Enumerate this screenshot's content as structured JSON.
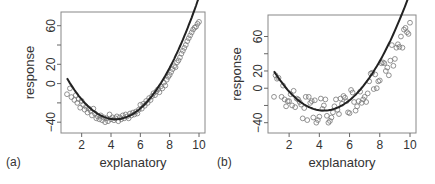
{
  "chart_data": [
    {
      "panel_label": "(a)",
      "type": "scatter",
      "title": "",
      "xlabel": "explanatory",
      "ylabel": "response",
      "xlim": [
        1,
        10
      ],
      "ylim": [
        -45,
        68
      ],
      "xticks": [
        2,
        4,
        6,
        8,
        10
      ],
      "yticks": [
        -40,
        -20,
        0,
        20,
        40,
        60
      ],
      "ytick_labels": [
        "-40",
        "",
        "0",
        "20",
        "",
        "60"
      ],
      "grid": false,
      "fit": {
        "type": "quadratic",
        "vertex_x": 4.3,
        "vertex_y": -37,
        "curve": "y = 3.9*(x-4.3)^2 - 37"
      },
      "points_x": [
        1.0,
        1.2,
        1.3,
        1.5,
        1.6,
        1.7,
        1.8,
        1.9,
        2.0,
        2.1,
        2.2,
        2.3,
        2.4,
        2.5,
        2.6,
        2.7,
        2.8,
        2.9,
        3.0,
        3.1,
        3.2,
        3.3,
        3.4,
        3.5,
        3.6,
        3.7,
        3.8,
        3.9,
        4.0,
        4.1,
        4.2,
        4.3,
        4.4,
        4.5,
        4.6,
        4.7,
        4.8,
        4.9,
        5.0,
        5.1,
        5.2,
        5.3,
        5.4,
        5.5,
        5.6,
        5.7,
        5.8,
        5.9,
        6.0,
        6.1,
        6.2,
        6.3,
        6.4,
        6.5,
        6.6,
        6.7,
        6.8,
        6.9,
        7.0,
        7.1,
        7.2,
        7.3,
        7.4,
        7.5,
        7.6,
        7.7,
        7.8,
        7.9,
        8.0,
        8.1,
        8.2,
        8.3,
        8.4,
        8.5,
        8.6,
        8.7,
        8.8,
        8.9,
        9.0,
        9.1,
        9.2,
        9.3,
        9.4,
        9.5,
        9.6,
        9.7,
        9.8,
        9.9,
        10.0
      ],
      "points_y": [
        -11,
        -5,
        -14,
        -17,
        -12,
        -20,
        -16,
        -25,
        -18,
        -22,
        -27,
        -24,
        -30,
        -26,
        -28,
        -33,
        -26,
        -31,
        -36,
        -34,
        -37,
        -33,
        -38,
        -35,
        -40,
        -36,
        -39,
        -32,
        -37,
        -35,
        -38,
        -36,
        -34,
        -39,
        -35,
        -37,
        -33,
        -36,
        -32,
        -34,
        -36,
        -31,
        -33,
        -30,
        -32,
        -29,
        -31,
        -27,
        -22,
        -26,
        -21,
        -23,
        -18,
        -20,
        -15,
        -17,
        -13,
        -10,
        -12,
        -8,
        -6,
        -9,
        -3,
        -5,
        1,
        -2,
        4,
        7,
        9,
        12,
        15,
        18,
        17,
        22,
        24,
        27,
        31,
        34,
        37,
        40,
        44,
        47,
        50,
        53,
        56,
        58,
        59,
        62,
        64
      ]
    },
    {
      "panel_label": "(b)",
      "type": "scatter",
      "title": "",
      "xlabel": "explanatory",
      "ylabel": "response",
      "xlim": [
        1,
        10
      ],
      "ylim": [
        -45,
        78
      ],
      "xticks": [
        2,
        4,
        6,
        8,
        10
      ],
      "yticks": [
        -40,
        -20,
        0,
        20,
        40,
        60
      ],
      "ytick_labels": [
        "-40",
        "",
        "0",
        "20",
        "",
        "60"
      ],
      "grid": false,
      "fit": {
        "type": "quadratic",
        "vertex_x": 4.3,
        "vertex_y": -26,
        "curve": "y = 4.2*(x-4.3)^2 - 26"
      },
      "points_x": [
        1.0,
        1.1,
        1.2,
        1.3,
        1.5,
        1.6,
        1.7,
        1.8,
        1.9,
        2.0,
        2.1,
        2.2,
        2.3,
        2.4,
        2.5,
        2.6,
        2.7,
        2.8,
        2.9,
        3.0,
        3.1,
        3.2,
        3.3,
        3.4,
        3.5,
        3.6,
        3.7,
        3.8,
        3.9,
        4.0,
        4.1,
        4.2,
        4.3,
        4.4,
        4.5,
        4.6,
        4.7,
        4.8,
        4.9,
        5.0,
        5.1,
        5.2,
        5.3,
        5.4,
        5.5,
        5.6,
        5.7,
        5.8,
        5.9,
        6.0,
        6.1,
        6.2,
        6.3,
        6.4,
        6.5,
        6.6,
        6.7,
        6.8,
        6.9,
        7.0,
        7.1,
        7.2,
        7.3,
        7.4,
        7.5,
        7.6,
        7.7,
        7.8,
        7.9,
        8.0,
        8.1,
        8.2,
        8.3,
        8.4,
        8.5,
        8.6,
        8.7,
        8.8,
        8.9,
        9.0,
        9.1,
        9.2,
        9.3,
        9.4,
        9.5,
        9.6,
        9.7,
        9.8,
        9.9,
        10.0
      ],
      "points_y": [
        -10,
        15,
        11,
        12,
        -10,
        3,
        -13,
        -21,
        -15,
        -15,
        -7,
        -20,
        -3,
        -22,
        -12,
        -13,
        -16,
        -19,
        -35,
        -23,
        -10,
        -37,
        -10,
        -17,
        -15,
        -34,
        -14,
        -40,
        -37,
        -33,
        -12,
        -24,
        -20,
        -13,
        -32,
        -40,
        -38,
        -34,
        -28,
        -21,
        -13,
        -25,
        -30,
        -12,
        -18,
        -9,
        -11,
        -15,
        -28,
        -29,
        -2,
        -5,
        -16,
        -26,
        -21,
        -15,
        -4,
        -17,
        -13,
        -10,
        -16,
        -6,
        8,
        17,
        18,
        -1,
        16,
        0,
        8,
        9,
        29,
        30,
        29,
        20,
        24,
        15,
        32,
        50,
        26,
        34,
        47,
        51,
        48,
        60,
        47,
        68,
        70,
        65,
        63,
        76
      ]
    }
  ]
}
